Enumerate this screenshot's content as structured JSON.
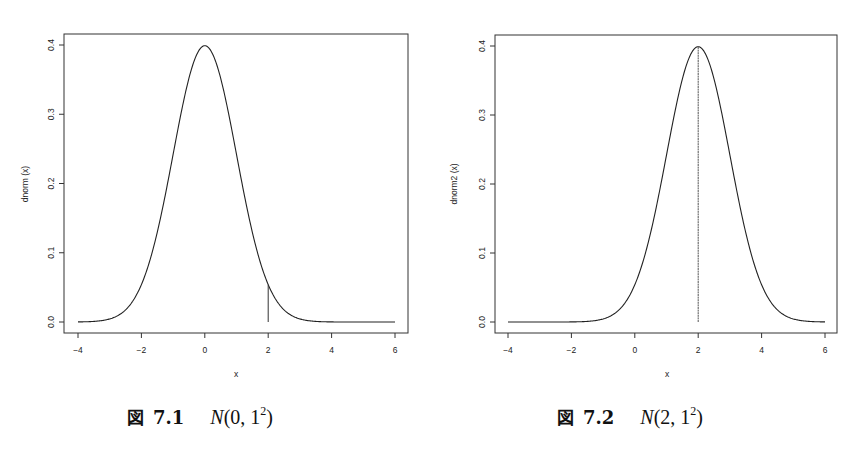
{
  "chart_data": [
    {
      "type": "line",
      "title": "",
      "xlabel": "x",
      "ylabel": "dnorm (x)",
      "xlim": [
        -4,
        6
      ],
      "ylim": [
        0,
        0.4
      ],
      "x_ticks": [
        "-4",
        "-2",
        "0",
        "2",
        "4",
        "6"
      ],
      "y_ticks": [
        "0.0",
        "0.1",
        "0.2",
        "0.3",
        "0.4"
      ],
      "grid": false,
      "series": [
        {
          "name": "dnorm(x)",
          "distribution": "normal",
          "mean": 0,
          "sd": 1,
          "x": [
            -4,
            -3,
            -2,
            -1.5,
            -1,
            -0.5,
            0,
            0.5,
            1,
            1.5,
            2,
            3,
            4,
            5,
            6
          ],
          "y": [
            0.0001,
            0.0044,
            0.054,
            0.1295,
            0.242,
            0.3521,
            0.3989,
            0.3521,
            0.242,
            0.1295,
            0.054,
            0.0044,
            0.0001,
            0.0,
            0.0
          ]
        }
      ],
      "annotations": [
        {
          "type": "vertical_segment",
          "x": 2,
          "y_from": 0,
          "y_to": 0.054
        }
      ],
      "caption": {
        "prefix": "図",
        "number": "7.1",
        "math": {
          "dist": "N",
          "args": "(0, 1",
          "sup": "2",
          "close": ")"
        }
      }
    },
    {
      "type": "line",
      "title": "",
      "xlabel": "x",
      "ylabel": "dnorm2 (x)",
      "xlim": [
        -4,
        6
      ],
      "ylim": [
        0,
        0.4
      ],
      "x_ticks": [
        "-4",
        "-2",
        "0",
        "2",
        "4",
        "6"
      ],
      "y_ticks": [
        "0.0",
        "0.1",
        "0.2",
        "0.3",
        "0.4"
      ],
      "grid": false,
      "series": [
        {
          "name": "dnorm2(x)",
          "distribution": "normal",
          "mean": 2,
          "sd": 1,
          "x": [
            -4,
            -2,
            -1,
            0,
            0.5,
            1,
            1.5,
            2,
            2.5,
            3,
            3.5,
            4,
            5,
            6
          ],
          "y": [
            0.0,
            0.0001,
            0.0044,
            0.054,
            0.1295,
            0.242,
            0.3521,
            0.3989,
            0.3521,
            0.242,
            0.1295,
            0.054,
            0.0044,
            0.0001
          ]
        }
      ],
      "annotations": [
        {
          "type": "vertical_segment",
          "x": 2,
          "y_from": 0,
          "y_to": 0.3989
        }
      ],
      "caption": {
        "prefix": "図",
        "number": "7.2",
        "math": {
          "dist": "N",
          "args": "(2, 1",
          "sup": "2",
          "close": ")"
        }
      }
    }
  ]
}
